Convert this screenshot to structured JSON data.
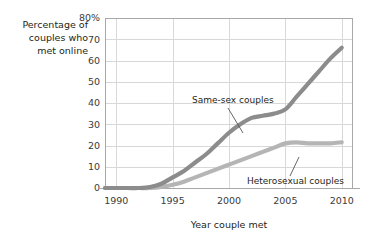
{
  "chart_data": {
    "type": "line",
    "title": "",
    "xlabel": "Year couple met",
    "ylabel": "Percentage of couples who met online",
    "ylabel_lines": [
      "Percentage of",
      "couples who",
      "met online"
    ],
    "xlim": [
      1989,
      2011
    ],
    "ylim": [
      0,
      80
    ],
    "grid": true,
    "legend_position": "inline-annotations",
    "y_ticks": [
      0,
      10,
      20,
      30,
      40,
      50,
      60,
      70,
      80
    ],
    "y_tick_labels": [
      "0",
      "10",
      "20",
      "30",
      "40",
      "50",
      "60",
      "70",
      "80%"
    ],
    "x_ticks": [
      1990,
      1995,
      2000,
      2005,
      2010
    ],
    "x_tick_labels": [
      "1990",
      "1995",
      "2000",
      "2005",
      "2010"
    ],
    "series": [
      {
        "name": "Same-sex couples",
        "color": "#8c8c8c",
        "x": [
          1989,
          1990,
          1991,
          1992,
          1993,
          1994,
          1995,
          1996,
          1997,
          1998,
          1999,
          2000,
          2001,
          2002,
          2003,
          2004,
          2005,
          2006,
          2007,
          2008,
          2009,
          2010
        ],
        "values": [
          0,
          0,
          0,
          0,
          0.5,
          2,
          5,
          8,
          12,
          16,
          21,
          26,
          30,
          33,
          34,
          35,
          37,
          43,
          49,
          55,
          61,
          66
        ]
      },
      {
        "name": "Heterosexual couples",
        "color": "#b5b5b5",
        "x": [
          1989,
          1990,
          1991,
          1992,
          1993,
          1994,
          1995,
          1996,
          1997,
          1998,
          1999,
          2000,
          2001,
          2002,
          2003,
          2004,
          2005,
          2006,
          2007,
          2008,
          2009,
          2010
        ],
        "values": [
          0,
          0,
          0,
          0,
          0,
          0.5,
          1.5,
          3,
          5,
          7,
          9,
          11,
          13,
          15,
          17,
          19,
          21,
          21.5,
          21,
          21,
          21,
          21.5
        ]
      }
    ],
    "annotations": [
      {
        "text": "Same-sex couples",
        "series": "Same-sex couples"
      },
      {
        "text": "Heterosexual couples",
        "series": "Heterosexual couples"
      }
    ],
    "colors": {
      "background": "#ffffff",
      "grid": "#d8d8d8",
      "axis": "#a8a8a8",
      "text": "#231f20",
      "same_sex_line": "#8c8c8c",
      "heterosexual_line": "#b5b5b5",
      "leader_line": "#555555"
    }
  }
}
